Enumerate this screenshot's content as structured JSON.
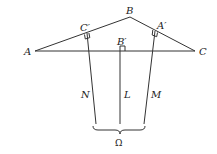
{
  "diagram": {
    "type": "geometry",
    "colors": {
      "stroke": "#333333",
      "text": "#222222",
      "background": "#ffffff"
    },
    "points": {
      "A": {
        "label": "A",
        "x": 35,
        "y": 51
      },
      "B": {
        "label": "B",
        "x": 130,
        "y": 17
      },
      "C": {
        "label": "C",
        "x": 195,
        "y": 51
      },
      "C_prime": {
        "label": "C′",
        "x": 87,
        "y": 33
      },
      "B_prime": {
        "label": "B′",
        "x": 120,
        "y": 51
      },
      "A_prime": {
        "label": "A′",
        "x": 155,
        "y": 31
      }
    },
    "lines": {
      "N": {
        "label": "N"
      },
      "L": {
        "label": "L"
      },
      "M": {
        "label": "M"
      }
    },
    "brace": {
      "label": "Ω"
    }
  }
}
